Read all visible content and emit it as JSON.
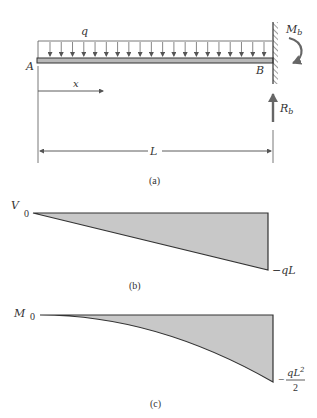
{
  "figure": {
    "panel_a": {
      "caption": "(a)",
      "load_label": "q",
      "left_support_label": "A",
      "right_support_label": "B",
      "moment_label": "M",
      "moment_sub": "b",
      "reaction_label": "R",
      "reaction_sub": "b",
      "position_label": "x",
      "length_label": "L",
      "load_arrow_count": 20
    },
    "panel_b": {
      "caption": "(b)",
      "axis_label": "V",
      "zero_label": "0",
      "end_value_label": "−qL"
    },
    "panel_c": {
      "caption": "(c)",
      "axis_label": "M",
      "zero_label": "0",
      "end_value_minus": "−",
      "end_value_numerator": "qL",
      "end_value_exponent": "2",
      "end_value_denominator": "2"
    },
    "colors": {
      "line": "#333333",
      "beam_fill": "#b8b8b8",
      "diagram_fill": "#c8c8c8",
      "arrow": "#666666"
    }
  },
  "chart_data": [
    {
      "type": "area",
      "title": "(b) Shear force diagram",
      "xlabel": "x",
      "ylabel": "V",
      "x": [
        0,
        1
      ],
      "values": [
        0,
        -1
      ],
      "value_labels": [
        "0",
        "−qL"
      ],
      "description": "Linear shear from 0 at A to -qL at B"
    },
    {
      "type": "area",
      "title": "(c) Bending moment diagram",
      "xlabel": "x",
      "ylabel": "M",
      "x": [
        0,
        0.25,
        0.5,
        0.75,
        1
      ],
      "values": [
        0,
        -0.03125,
        -0.125,
        -0.28125,
        -0.5
      ],
      "value_labels": [
        "0",
        "−qL²/2"
      ],
      "description": "Parabolic moment M = -qx²/2, from 0 at A to -qL²/2 at B"
    }
  ]
}
